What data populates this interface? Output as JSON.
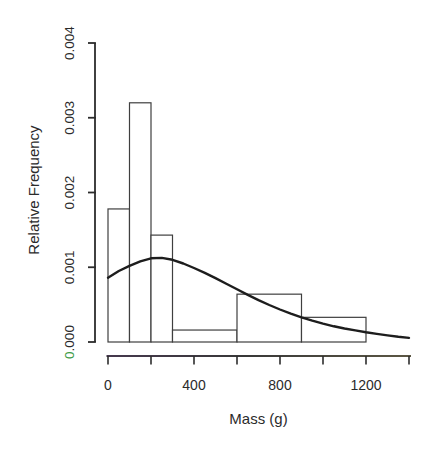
{
  "figure": {
    "background": "#ffffff",
    "text_color": "#2b2b2b",
    "axis_color": "#2c2c2c",
    "bar_edge_color": "#3f3f3f",
    "bar_fill": "#ffffff",
    "curve_color": "#1d1d1d",
    "artifact_green": "#3f9c48",
    "xaxis_tint_left": "#46394e",
    "xaxis_tint_mid": "#383838",
    "xaxis_tint_right": "#5c5744"
  },
  "chart_data": {
    "type": "bar",
    "subtype": "histogram-with-density-curve",
    "title": "",
    "xlabel": "Mass (g)",
    "ylabel": "Relative Frequency",
    "xlim": [
      0,
      1400
    ],
    "ylim": [
      0,
      0.004
    ],
    "grid": false,
    "legend": null,
    "x_ticks": [
      0,
      200,
      400,
      600,
      800,
      1000,
      1200,
      1400
    ],
    "x_tick_labels": [
      "0",
      "",
      "400",
      "",
      "800",
      "",
      "1200",
      ""
    ],
    "y_ticks": [
      0,
      0.001,
      0.002,
      0.003,
      0.004
    ],
    "y_tick_labels": [
      "0.000",
      "0.001",
      "0.002",
      "0.003",
      "0.004"
    ],
    "bins": [
      {
        "x0": 0,
        "x1": 100,
        "density": 0.00178
      },
      {
        "x0": 100,
        "x1": 200,
        "density": 0.0032
      },
      {
        "x0": 200,
        "x1": 300,
        "density": 0.00143
      },
      {
        "x0": 300,
        "x1": 600,
        "density": 0.00016
      },
      {
        "x0": 600,
        "x1": 900,
        "density": 0.00064
      },
      {
        "x0": 900,
        "x1": 1200,
        "density": 0.00033
      }
    ],
    "curve": {
      "name": "fitted-density-curve",
      "x": [
        0,
        50,
        100,
        150,
        200,
        250,
        300,
        350,
        400,
        450,
        500,
        550,
        600,
        650,
        700,
        750,
        800,
        850,
        900,
        950,
        1000,
        1050,
        1100,
        1150,
        1200,
        1250,
        1300,
        1350,
        1400
      ],
      "y": [
        0.00086,
        0.00095,
        0.00102,
        0.00108,
        0.00112,
        0.001125,
        0.0011,
        0.00105,
        0.00099,
        0.000925,
        0.000855,
        0.00078,
        0.000705,
        0.00063,
        0.00056,
        0.000495,
        0.000435,
        0.00038,
        0.00033,
        0.000285,
        0.000245,
        0.00021,
        0.00018,
        0.000155,
        0.00013,
        0.000108,
        8.8e-05,
        7e-05,
        5.5e-05
      ]
    }
  }
}
